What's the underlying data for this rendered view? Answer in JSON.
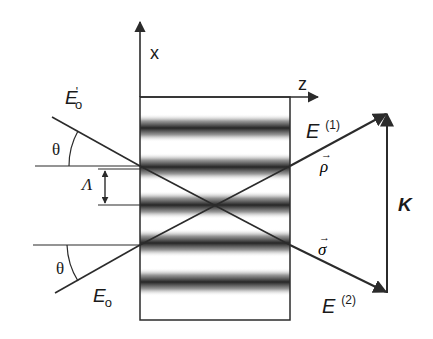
{
  "figure": {
    "type": "holographic grating coupled-wave geometry",
    "colors": {
      "line": "#2b2b2b",
      "stripe_dark": "#2e2e2e",
      "stripe_mid": "#8a8a8a",
      "background": "#ffffff"
    }
  },
  "axes": {
    "x_label": "x",
    "z_label": "z"
  },
  "beams": {
    "incident_upper": {
      "label": "E",
      "subscript": "o",
      "prime": "'"
    },
    "incident_lower": {
      "label": "E",
      "subscript": "o"
    },
    "angle_upper": "θ",
    "angle_lower": "θ",
    "diffracted_1": {
      "label": "E",
      "superscript": "(1)",
      "vector": "ρ"
    },
    "diffracted_2": {
      "label": "E",
      "superscript": "(2)",
      "vector": "σ"
    }
  },
  "grating": {
    "period_label": "Λ",
    "fringe_count": 5
  },
  "grating_vector": {
    "label": "K"
  }
}
